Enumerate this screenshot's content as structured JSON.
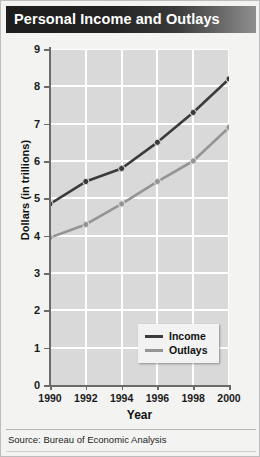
{
  "title": "Personal Income and Outlays",
  "source": "Source: Bureau of Economic Analysis",
  "legend": {
    "items": [
      {
        "label": "Income",
        "color": "#3b3b3b"
      },
      {
        "label": "Outlays",
        "color": "#949494"
      }
    ]
  },
  "colors": {
    "income": "#3b3b3b",
    "outlays": "#949494",
    "plot_background": "#d9d9d9",
    "gridline": "#ffffff",
    "axis": "#6b6b6b",
    "title_bar_dark": "#1d1d1d",
    "title_bar_light": "#8f8f8f",
    "page_background": "#f3f3f1"
  },
  "chart_data": {
    "type": "line",
    "title": "Personal Income and Outlays",
    "xlabel": "Year",
    "ylabel": "Dollars (in trillions)",
    "x": [
      1990,
      1992,
      1994,
      1996,
      1998,
      2000
    ],
    "categories": [
      "1990",
      "1992",
      "1994",
      "1996",
      "1998",
      "2000"
    ],
    "xlim": [
      1990,
      2000
    ],
    "ylim": [
      0,
      9
    ],
    "yticks": [
      0,
      1,
      2,
      3,
      4,
      5,
      6,
      7,
      8,
      9
    ],
    "ytick_labels": [
      "0",
      "1",
      "2",
      "3",
      "4",
      "5",
      "6",
      "7",
      "8",
      "9"
    ],
    "xticks": [
      1990,
      1992,
      1994,
      1996,
      1998,
      2000
    ],
    "xtick_labels": [
      "1990",
      "1992",
      "1994",
      "1996",
      "1998",
      "2000"
    ],
    "grid": true,
    "legend_position": "bottom-right",
    "series": [
      {
        "name": "Income",
        "color": "#3b3b3b",
        "values": [
          4.85,
          5.45,
          5.8,
          6.5,
          7.3,
          8.2
        ]
      },
      {
        "name": "Outlays",
        "color": "#949494",
        "values": [
          3.95,
          4.3,
          4.85,
          5.45,
          6.0,
          6.9
        ]
      }
    ],
    "source": "Source: Bureau of Economic Analysis"
  }
}
